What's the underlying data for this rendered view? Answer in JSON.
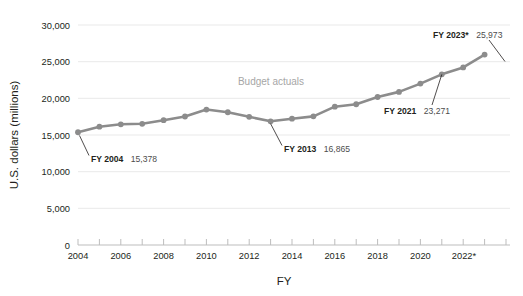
{
  "chart_data": {
    "type": "line",
    "title": "",
    "xlabel": "FY",
    "ylabel": "U.S. dollars (millions)",
    "grid": true,
    "legend": false,
    "series_label": "Budget actuals",
    "xlim": [
      2004,
      2024
    ],
    "ylim": [
      0,
      30000
    ],
    "x": [
      2004,
      2005,
      2006,
      2007,
      2008,
      2009,
      2010,
      2011,
      2012,
      2013,
      2014,
      2015,
      2016,
      2017,
      2018,
      2019,
      2020,
      2021,
      2022,
      2023
    ],
    "series": [
      {
        "name": "Budget actuals",
        "color": "#8c8c8c",
        "values": [
          15378,
          16130,
          16460,
          16530,
          17020,
          17520,
          18470,
          18100,
          17480,
          16865,
          17220,
          17540,
          18860,
          19190,
          20180,
          20880,
          22010,
          23271,
          24220,
          25973
        ]
      }
    ],
    "y_ticks": [
      0,
      5000,
      10000,
      15000,
      20000,
      25000,
      30000
    ],
    "y_tick_labels": [
      "0",
      "5,000",
      "10,000",
      "15,000",
      "20,000",
      "25,000",
      "30,000"
    ],
    "x_ticks": [
      2004,
      2006,
      2008,
      2010,
      2012,
      2014,
      2016,
      2018,
      2020,
      2022
    ],
    "x_tick_labels": [
      "2004",
      "2006",
      "2008",
      "2010",
      "2012",
      "2014",
      "2016",
      "2018",
      "2020",
      "2022*"
    ],
    "annotations": [
      {
        "id": "fy2004",
        "bold": "FY 2004",
        "value": "15,378",
        "x": 2004,
        "y": 15378
      },
      {
        "id": "fy2013",
        "bold": "FY 2013",
        "value": "16,865",
        "x": 2013,
        "y": 16865
      },
      {
        "id": "fy2021",
        "bold": "FY 2021",
        "value": "23,271",
        "x": 2021,
        "y": 23271
      },
      {
        "id": "fy2023",
        "bold": "FY 2023*",
        "value": "25,973",
        "x": 2023,
        "y": 25973
      }
    ]
  },
  "axis": {
    "y_title": "U.S. dollars (millions)",
    "x_title": "FY",
    "y_labels": {
      "t0": "0",
      "t1": "5,000",
      "t2": "10,000",
      "t3": "15,000",
      "t4": "20,000",
      "t5": "25,000",
      "t6": "30,000"
    },
    "x_labels": {
      "t0": "2004",
      "t1": "2006",
      "t2": "2008",
      "t3": "2010",
      "t4": "2012",
      "t5": "2014",
      "t6": "2016",
      "t7": "2018",
      "t8": "2020",
      "t9": "2022*"
    }
  },
  "series_note": "Budget actuals",
  "annotations": {
    "a0": {
      "bold": "FY 2004",
      "value": "15,378"
    },
    "a1": {
      "bold": "FY 2013",
      "value": "16,865"
    },
    "a2": {
      "bold": "FY 2021",
      "value": "23,271"
    },
    "a3": {
      "bold": "FY 2023*",
      "value": "25,973"
    }
  },
  "colors": {
    "line": "#8c8c8c",
    "marker": "#8c8c8c",
    "grid": "#e9e9e9",
    "axis": "#bdbdbd",
    "note": "#a6a6a6",
    "text": "#231f20"
  }
}
